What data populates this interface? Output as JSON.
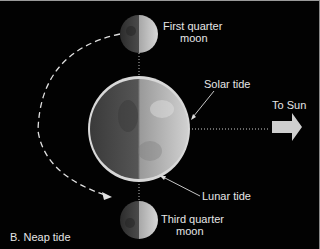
{
  "diagram": {
    "panel_label": "B. Neap tide",
    "labels": {
      "first_quarter_line1": "First quarter",
      "first_quarter_line2": "moon",
      "third_quarter_line1": "Third quarter",
      "third_quarter_line2": "moon",
      "solar_tide": "Solar tide",
      "lunar_tide": "Lunar tide",
      "to_sun": "To Sun"
    },
    "colors": {
      "background": "#020202",
      "text": "#e6e6e6",
      "arrow": "#cfcfcf",
      "earth_dark": "#4a4a4a",
      "earth_light": "#bdbdbd"
    }
  }
}
